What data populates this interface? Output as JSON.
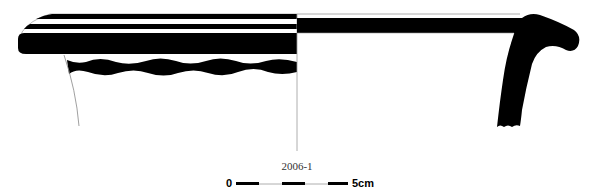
{
  "figure": {
    "type": "pottery profile drawing",
    "catalog_number": "2006-1",
    "colors": {
      "ink": "#000000",
      "guide_line": "#999999",
      "background": "#ffffff"
    }
  },
  "scale_bar": {
    "start_label": "0",
    "end_label": "5cm",
    "segments": 5
  }
}
